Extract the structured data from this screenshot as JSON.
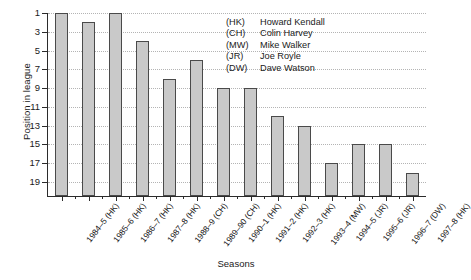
{
  "chart_data": {
    "type": "bar",
    "title": "",
    "xlabel": "Seasons",
    "ylabel": "Position in league",
    "categories": [
      "1984–5 (HK)",
      "1985–6 (HK)",
      "1986–7 (HK)",
      "1987–8 (HK)",
      "1988–9 (CH)",
      "1989–90 (CH)",
      "1990–1 (HK)",
      "1991–2 (HK)",
      "1992–3 (HK)",
      "1993–4 (MW)",
      "1994–5 (JR)",
      "1995–6 (JR)",
      "1996–7 (DW)",
      "1997–8 (HK)"
    ],
    "values": [
      1,
      2,
      1,
      4,
      8,
      6,
      9,
      9,
      12,
      13,
      17,
      15,
      15,
      18
    ],
    "yticks": [
      1,
      3,
      5,
      7,
      9,
      11,
      13,
      15,
      17,
      19
    ],
    "ylim": [
      1,
      20.5
    ],
    "y_axis_inverted": true,
    "grid": "horizontal-dotted",
    "legend_position": "inside-top-right",
    "bar_fill_color": "#c9c9c9",
    "bar_edge_color": "#4a4a4a",
    "gridline_color": "#b4b4b4",
    "axis_color": "#2b2b2b",
    "legend": [
      {
        "code": "(HK)",
        "name": "Howard Kendall"
      },
      {
        "code": "(CH)",
        "name": "Colin Harvey"
      },
      {
        "code": "(MW)",
        "name": "Mike Walker"
      },
      {
        "code": "(JR)",
        "name": "Joe Royle"
      },
      {
        "code": "(DW)",
        "name": "Dave Watson"
      }
    ]
  }
}
